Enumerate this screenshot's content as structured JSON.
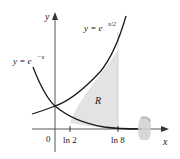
{
  "diagram": {
    "axes": {
      "x_label": "x",
      "y_label": "y",
      "origin_label": "0"
    },
    "ticks": [
      {
        "label": "ln 2",
        "value": 0.693
      },
      {
        "label": "ln 8",
        "value": 2.079
      }
    ],
    "curves": [
      {
        "name": "growth",
        "label": "y = e",
        "exponent": "x/2"
      },
      {
        "name": "decay",
        "label": "y = e",
        "exponent": "−x"
      }
    ],
    "region": {
      "label": "R",
      "from": "ln 2",
      "to": "ln 8",
      "fill": "#e3e3e3"
    },
    "rotation_symbol": "rotation-about-x-axis",
    "colors": {
      "curve": "#1a1a1a",
      "axis": "#555555",
      "region": "#e3e3e3"
    }
  }
}
